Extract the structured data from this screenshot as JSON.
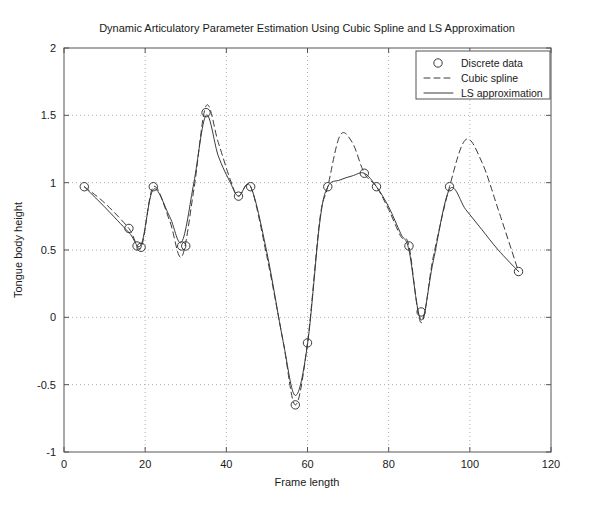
{
  "chart_data": {
    "type": "line",
    "title": "Dynamic Articulatory Parameter Estimation Using Cubic Spline and LS Approximation",
    "xlabel": "Frame length",
    "ylabel": "Tongue body height",
    "xlim": [
      0,
      120
    ],
    "ylim": [
      -1,
      2
    ],
    "xticks": [
      0,
      20,
      40,
      60,
      80,
      100,
      120
    ],
    "xticklabels": [
      "0",
      "20",
      "40",
      "60",
      "80",
      "100",
      "120"
    ],
    "yticks": [
      -1,
      -0.5,
      0,
      0.5,
      1,
      1.5,
      2
    ],
    "yticklabels": [
      "-1",
      "-0.5",
      "0",
      "0.5",
      "1",
      "1.5",
      "2"
    ],
    "grid": true,
    "grid_style": "dotted",
    "legend_position": "top-right",
    "legend": [
      {
        "label": "Discrete data",
        "style": "marker-circle"
      },
      {
        "label": "Cubic spline",
        "style": "dashed-line"
      },
      {
        "label": "LS approximation",
        "style": "solid-line"
      }
    ],
    "series": [
      {
        "name": "Discrete data",
        "style": "marker-circle",
        "x": [
          5,
          16,
          18,
          22,
          30,
          35,
          43,
          46,
          60,
          65,
          74,
          77,
          85,
          88,
          95,
          112
        ],
        "y": [
          0.97,
          0.66,
          0.53,
          0.97,
          0.53,
          1.52,
          0.9,
          0.97,
          -0.19,
          0.97,
          1.07,
          0.97,
          0.53,
          0.04,
          0.97,
          0.34
        ],
        "extra_points_x": [
          19,
          29,
          57
        ],
        "extra_points_y": [
          0.52,
          0.53,
          -0.65
        ]
      },
      {
        "name": "Cubic spline",
        "style": "dashed",
        "x": [
          5,
          10,
          16,
          19,
          22,
          26,
          29,
          32,
          35,
          38,
          41,
          43,
          46,
          50,
          54,
          57,
          60,
          63,
          65,
          68,
          71,
          74,
          77,
          80,
          83,
          85,
          88,
          91,
          95,
          99,
          103,
          107,
          112
        ],
        "y": [
          0.97,
          0.85,
          0.66,
          0.52,
          0.97,
          0.72,
          0.45,
          0.95,
          1.57,
          1.3,
          1.02,
          0.9,
          0.97,
          0.45,
          -0.18,
          -0.65,
          -0.19,
          0.72,
          0.97,
          1.35,
          1.3,
          1.07,
          0.97,
          0.8,
          0.6,
          0.53,
          -0.04,
          0.45,
          0.97,
          1.32,
          1.15,
          0.8,
          0.34
        ]
      },
      {
        "name": "LS approximation",
        "style": "solid",
        "x": [
          5,
          10,
          16,
          19,
          22,
          26,
          29,
          32,
          35,
          38,
          41,
          43,
          46,
          50,
          54,
          57,
          60,
          63,
          65,
          68,
          71,
          74,
          77,
          80,
          83,
          85,
          88,
          91,
          95,
          99,
          103,
          107,
          112
        ],
        "y": [
          0.97,
          0.82,
          0.63,
          0.54,
          0.95,
          0.75,
          0.56,
          1.0,
          1.5,
          1.2,
          1.0,
          0.9,
          0.97,
          0.48,
          -0.18,
          -0.58,
          -0.2,
          0.7,
          0.97,
          1.02,
          1.05,
          1.07,
          0.97,
          0.82,
          0.62,
          0.5,
          -0.02,
          0.42,
          0.95,
          0.8,
          0.65,
          0.5,
          0.34
        ]
      }
    ]
  }
}
